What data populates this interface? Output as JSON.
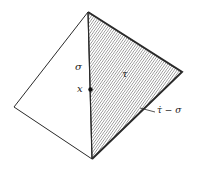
{
  "figure": {
    "vertices": {
      "top": [
        88,
        12
      ],
      "left": [
        14,
        107
      ],
      "bottom": [
        92,
        159
      ],
      "right": [
        182,
        72
      ]
    },
    "labels": {
      "sigma": "σ",
      "x": "x",
      "tau": "τ",
      "boundary": "τ̇ − σ"
    },
    "colors": {
      "stroke": "#2a2a2a",
      "hatch": "#555555",
      "background": "#ffffff"
    }
  }
}
